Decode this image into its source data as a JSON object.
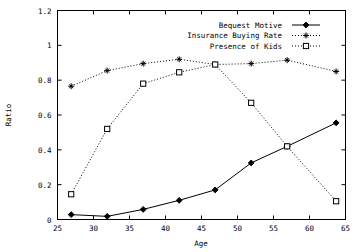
{
  "chart_data": {
    "type": "line",
    "title": "",
    "xlabel": "Age",
    "ylabel": "Ratio",
    "xlim": [
      25,
      65
    ],
    "ylim": [
      0,
      1.2
    ],
    "xticks": [
      25,
      30,
      35,
      40,
      45,
      50,
      55,
      60,
      65
    ],
    "xtick_labels": [
      "25",
      "30",
      "35",
      "40",
      "45",
      "50",
      "55",
      "60",
      "65"
    ],
    "yticks": [
      0,
      0.2,
      0.4,
      0.6,
      0.8,
      1,
      1.2
    ],
    "ytick_labels": [
      "0",
      "0.2",
      "0.4",
      "0.6",
      "0.8",
      "1",
      "1.2"
    ],
    "grid": false,
    "legend_position": "top-right",
    "x": [
      26.9,
      31.9,
      36.9,
      41.9,
      46.9,
      51.9,
      56.9,
      63.7
    ],
    "series": [
      {
        "name": "Bequest Motive",
        "marker": "filled-diamond",
        "linestyle": "solid",
        "values": [
          0.028,
          0.018,
          0.058,
          0.11,
          0.17,
          0.325,
          0.42,
          0.555
        ]
      },
      {
        "name": "Insurance Buying Rate",
        "marker": "star",
        "linestyle": "dotted",
        "values": [
          0.765,
          0.855,
          0.895,
          0.92,
          0.89,
          0.895,
          0.915,
          0.85
        ]
      },
      {
        "name": "Presence of Kids",
        "marker": "open-square",
        "linestyle": "dotted",
        "values": [
          0.145,
          0.52,
          0.78,
          0.845,
          0.89,
          0.67,
          0.42,
          0.105
        ]
      }
    ]
  },
  "legend": {
    "items": [
      {
        "label": "Bequest Motive"
      },
      {
        "label": "Insurance Buying Rate"
      },
      {
        "label": "Presence of Kids"
      }
    ]
  },
  "axes": {
    "x_title": "Age",
    "y_title": "Ratio"
  }
}
